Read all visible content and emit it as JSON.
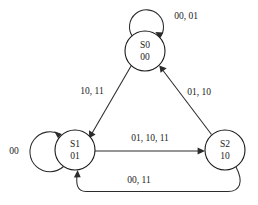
{
  "diagram": {
    "type": "finite-state-machine",
    "title": "",
    "background_color": "#ffffff",
    "stroke_color": "#2b2b2b",
    "text_color": "#1a1a1a",
    "states": [
      {
        "id": "S0",
        "name": "S0",
        "encoding": "00",
        "cx": 145,
        "cy": 51,
        "r": 20
      },
      {
        "id": "S1",
        "name": "S1",
        "encoding": "01",
        "cx": 75,
        "cy": 150,
        "r": 20
      },
      {
        "id": "S2",
        "name": "S2",
        "encoding": "10",
        "cx": 225,
        "cy": 150,
        "r": 20
      }
    ],
    "transitions": [
      {
        "id": "s0-self",
        "from": "S0",
        "to": "S0",
        "label": "00, 01",
        "label_x": 186,
        "label_y": 17
      },
      {
        "id": "s1-self",
        "from": "S1",
        "to": "S1",
        "label": "00",
        "label_x": 14,
        "label_y": 152
      },
      {
        "id": "s0-to-s1",
        "from": "S0",
        "to": "S1",
        "label": "10, 11",
        "label_x": 92,
        "label_y": 92
      },
      {
        "id": "s2-to-s0",
        "from": "S2",
        "to": "S0",
        "label": "01, 10",
        "label_x": 199,
        "label_y": 93
      },
      {
        "id": "s1-to-s2",
        "from": "S1",
        "to": "S2",
        "label": "01, 10, 11",
        "label_x": 150,
        "label_y": 139
      },
      {
        "id": "s2-to-s1",
        "from": "S2",
        "to": "S1",
        "label": "00, 11",
        "label_x": 139,
        "label_y": 181
      }
    ]
  }
}
